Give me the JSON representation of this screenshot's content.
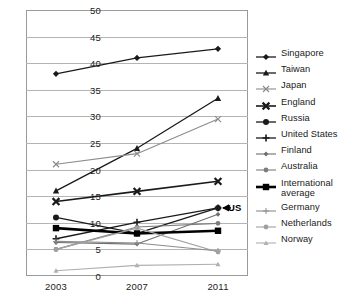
{
  "chart_data": {
    "type": "line",
    "title": "",
    "xlabel": "",
    "ylabel": "",
    "x": [
      "2003",
      "2007",
      "2011"
    ],
    "categories": [
      "2003",
      "2007",
      "2011"
    ],
    "ylim": [
      0,
      50
    ],
    "yticks": [
      0,
      5,
      10,
      15,
      20,
      25,
      30,
      35,
      40,
      45,
      50
    ],
    "grid": true,
    "legend_position": "right",
    "annotations": [
      {
        "text": "US",
        "series": "United States",
        "x": "2011",
        "y": 12.8,
        "arrow": true
      }
    ],
    "series": [
      {
        "name": "Singapore",
        "values": [
          38.0,
          41.0,
          42.7
        ],
        "marker": "diamond",
        "color": "#1a1a1a",
        "width": 1.3
      },
      {
        "name": "Taiwan",
        "values": [
          16.0,
          24.0,
          33.4
        ],
        "marker": "triangle",
        "color": "#1a1a1a",
        "width": 1.3
      },
      {
        "name": "Japan",
        "values": [
          21.0,
          23.0,
          29.5
        ],
        "marker": "x",
        "color": "#8c8c8c",
        "width": 1.1
      },
      {
        "name": "England",
        "values": [
          14.0,
          15.9,
          17.8
        ],
        "marker": "x-bold",
        "color": "#1a1a1a",
        "width": 1.6
      },
      {
        "name": "Russia",
        "values": [
          11.0,
          8.0,
          12.8
        ],
        "marker": "circle",
        "color": "#1a1a1a",
        "width": 1.3
      },
      {
        "name": "United States",
        "values": [
          7.0,
          10.1,
          12.8
        ],
        "marker": "plus",
        "color": "#1a1a1a",
        "width": 1.3
      },
      {
        "name": "Finland",
        "values": [
          6.3,
          6.0,
          11.6
        ],
        "marker": "small-diamond",
        "color": "#6e6e6e",
        "width": 1.1
      },
      {
        "name": "Australia",
        "values": [
          5.0,
          9.2,
          9.9
        ],
        "marker": "small-circle",
        "color": "#7d7d7d",
        "width": 1.1
      },
      {
        "name": "International\naverage",
        "values": [
          9.0,
          8.0,
          8.5
        ],
        "marker": "square",
        "color": "#000000",
        "width": 2.6
      },
      {
        "name": "Germany",
        "values": [
          6.5,
          6.2,
          4.7
        ],
        "marker": "plus-thin",
        "color": "#8c8c8c",
        "width": 1.1
      },
      {
        "name": "Netherlands",
        "values": [
          5.0,
          9.0,
          4.5
        ],
        "marker": "small-circle",
        "color": "#a0a0a0",
        "width": 1.1
      },
      {
        "name": "Norway",
        "values": [
          1.0,
          2.0,
          2.2
        ],
        "marker": "small-triangle",
        "color": "#b0b0b0",
        "width": 1.1
      }
    ]
  },
  "legend": {
    "items": [
      {
        "label": "Singapore"
      },
      {
        "label": "Taiwan"
      },
      {
        "label": "Japan"
      },
      {
        "label": "England"
      },
      {
        "label": "Russia"
      },
      {
        "label": "United States"
      },
      {
        "label": "Finland"
      },
      {
        "label": "Australia"
      },
      {
        "label": "International average"
      },
      {
        "label": "Germany"
      },
      {
        "label": "Netherlands"
      },
      {
        "label": "Norway"
      }
    ]
  },
  "annotation": {
    "us_label": "US"
  }
}
